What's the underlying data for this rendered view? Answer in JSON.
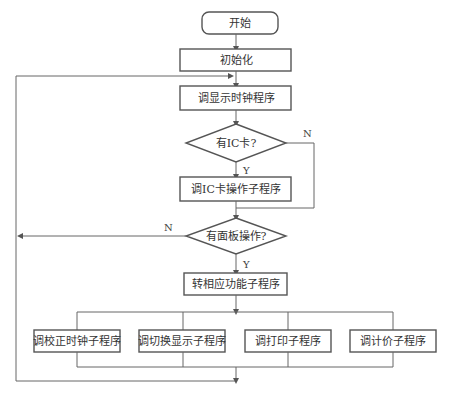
{
  "diagram": {
    "type": "flowchart",
    "nodes": {
      "start": "开始",
      "init": "初始化",
      "show_clock": "调显示时钟程序",
      "has_ic_card": "有IC卡?",
      "ic_card_sub": "调IC卡操作子程序",
      "has_panel_op": "有面板操作?",
      "dispatch": "转相应功能子程序",
      "sub_adjust_clock": "调校正时钟子程序",
      "sub_switch_display": "调切换显示子程序",
      "sub_print": "调打印子程序",
      "sub_pricing": "调计价子程序"
    },
    "labels": {
      "ic_yes": "Y",
      "ic_no": "N",
      "panel_yes": "Y",
      "panel_no": "N"
    }
  }
}
